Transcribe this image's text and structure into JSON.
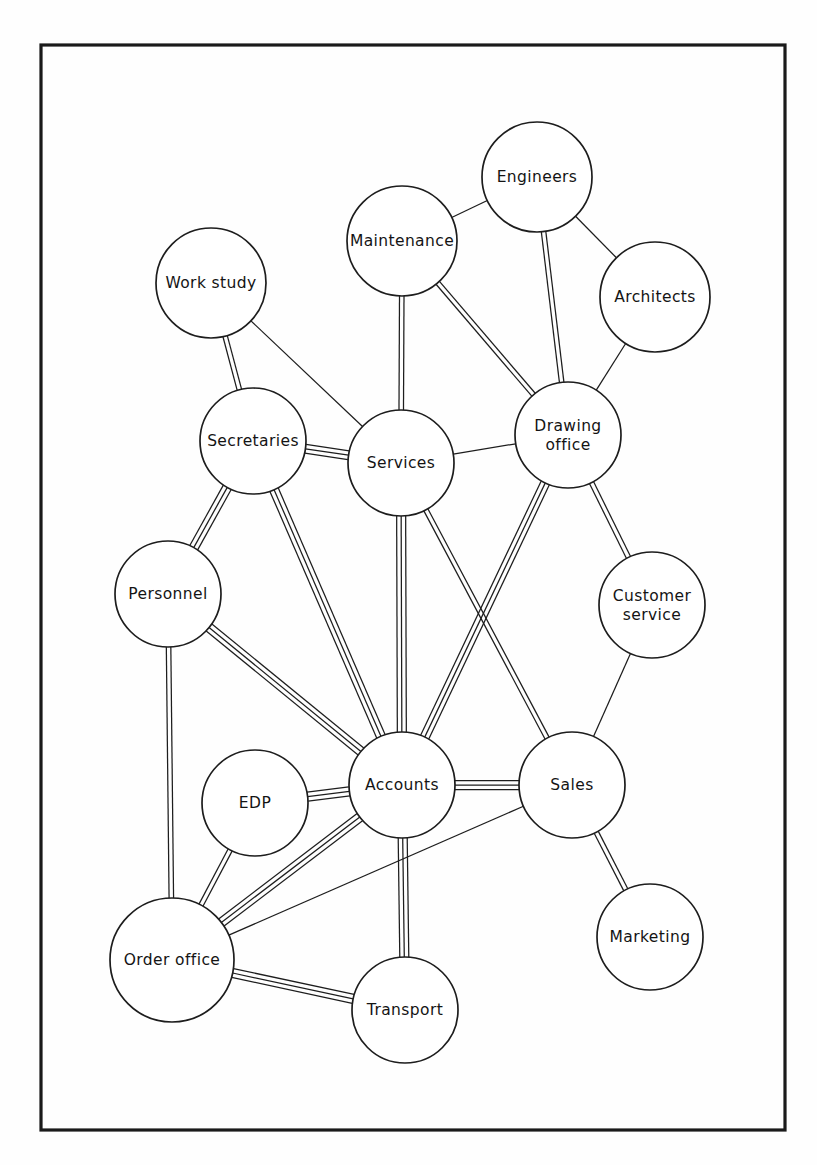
{
  "diagram": {
    "type": "network-graph",
    "frame": {
      "x": 41,
      "y": 45,
      "width": 744,
      "height": 1085,
      "stroke": "#1a1a1a"
    },
    "canvas": {
      "width": 817,
      "height": 1165,
      "background": "#ffffff"
    },
    "style": {
      "node_fill": "#ffffff",
      "node_stroke": "#1d1d1d",
      "edge_stroke": "#1d1d1d",
      "line_gap": 4.5,
      "legend": "edge weight encoded as number of parallel lines (1, 2 or 3)"
    },
    "nodes": [
      {
        "id": "work-study",
        "label": "Work study",
        "cx": 211,
        "cy": 283,
        "r": 55,
        "lines": [
          "Work study"
        ]
      },
      {
        "id": "maintenance",
        "label": "Maintenance",
        "cx": 402,
        "cy": 241,
        "r": 55,
        "lines": [
          "Maintenance"
        ]
      },
      {
        "id": "engineers",
        "label": "Engineers",
        "cx": 537,
        "cy": 177,
        "r": 55,
        "lines": [
          "Engineers"
        ]
      },
      {
        "id": "architects",
        "label": "Architects",
        "cx": 655,
        "cy": 297,
        "r": 55,
        "lines": [
          "Architects"
        ]
      },
      {
        "id": "secretaries",
        "label": "Secretaries",
        "cx": 253,
        "cy": 441,
        "r": 53,
        "lines": [
          "Secretaries"
        ]
      },
      {
        "id": "services",
        "label": "Services",
        "cx": 401,
        "cy": 463,
        "r": 53,
        "lines": [
          "Services"
        ]
      },
      {
        "id": "drawing-office",
        "label": "Drawing office",
        "cx": 568,
        "cy": 435,
        "r": 53,
        "lines": [
          "Drawing",
          "office"
        ]
      },
      {
        "id": "personnel",
        "label": "Personnel",
        "cx": 168,
        "cy": 594,
        "r": 53,
        "lines": [
          "Personnel"
        ]
      },
      {
        "id": "customer-service",
        "label": "Customer service",
        "cx": 652,
        "cy": 605,
        "r": 53,
        "lines": [
          "Customer",
          "service"
        ]
      },
      {
        "id": "accounts",
        "label": "Accounts",
        "cx": 402,
        "cy": 785,
        "r": 53,
        "lines": [
          "Accounts"
        ]
      },
      {
        "id": "sales",
        "label": "Sales",
        "cx": 572,
        "cy": 785,
        "r": 53,
        "lines": [
          "Sales"
        ]
      },
      {
        "id": "edp",
        "label": "EDP",
        "cx": 255,
        "cy": 803,
        "r": 53,
        "lines": [
          "EDP"
        ]
      },
      {
        "id": "order-office",
        "label": "Order office",
        "cx": 172,
        "cy": 960,
        "r": 62,
        "lines": [
          "Order office"
        ]
      },
      {
        "id": "transport",
        "label": "Transport",
        "cx": 405,
        "cy": 1010,
        "r": 53,
        "lines": [
          "Transport"
        ]
      },
      {
        "id": "marketing",
        "label": "Marketing",
        "cx": 650,
        "cy": 937,
        "r": 53,
        "lines": [
          "Marketing"
        ]
      }
    ],
    "edges": [
      {
        "source": "maintenance",
        "target": "engineers",
        "weight": 1
      },
      {
        "source": "engineers",
        "target": "architects",
        "weight": 1
      },
      {
        "source": "engineers",
        "target": "drawing-office",
        "weight": 2
      },
      {
        "source": "architects",
        "target": "drawing-office",
        "weight": 1
      },
      {
        "source": "maintenance",
        "target": "drawing-office",
        "weight": 2
      },
      {
        "source": "maintenance",
        "target": "services",
        "weight": 2
      },
      {
        "source": "work-study",
        "target": "secretaries",
        "weight": 2
      },
      {
        "source": "work-study",
        "target": "services",
        "weight": 1
      },
      {
        "source": "secretaries",
        "target": "services",
        "weight": 3
      },
      {
        "source": "secretaries",
        "target": "personnel",
        "weight": 3
      },
      {
        "source": "secretaries",
        "target": "accounts",
        "weight": 3
      },
      {
        "source": "services",
        "target": "drawing-office",
        "weight": 1
      },
      {
        "source": "services",
        "target": "accounts",
        "weight": 3
      },
      {
        "source": "services",
        "target": "sales",
        "weight": 2
      },
      {
        "source": "drawing-office",
        "target": "customer-service",
        "weight": 2
      },
      {
        "source": "drawing-office",
        "target": "accounts",
        "weight": 3
      },
      {
        "source": "customer-service",
        "target": "sales",
        "weight": 1
      },
      {
        "source": "personnel",
        "target": "accounts",
        "weight": 3
      },
      {
        "source": "personnel",
        "target": "order-office",
        "weight": 2
      },
      {
        "source": "accounts",
        "target": "edp",
        "weight": 3
      },
      {
        "source": "accounts",
        "target": "sales",
        "weight": 3
      },
      {
        "source": "accounts",
        "target": "order-office",
        "weight": 3
      },
      {
        "source": "accounts",
        "target": "transport",
        "weight": 3
      },
      {
        "source": "edp",
        "target": "order-office",
        "weight": 2
      },
      {
        "source": "order-office",
        "target": "sales",
        "weight": 1
      },
      {
        "source": "order-office",
        "target": "transport",
        "weight": 3
      },
      {
        "source": "sales",
        "target": "marketing",
        "weight": 2
      }
    ]
  }
}
